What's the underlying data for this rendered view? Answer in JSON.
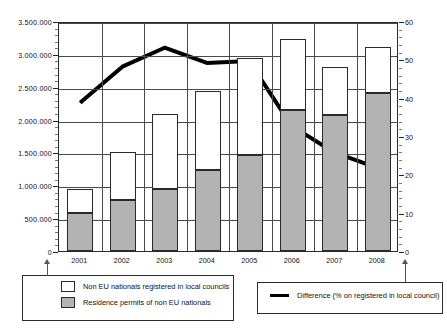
{
  "chart_data": {
    "type": "bar",
    "title": "",
    "subtitle": "",
    "xlabel": "",
    "ylabel": "",
    "y2label": "",
    "categories": [
      "2001",
      "2002",
      "2003",
      "2004",
      "2005",
      "2006",
      "2007",
      "2008"
    ],
    "ylim": [
      0,
      3500000
    ],
    "yticks": [
      "0",
      "500.000",
      "1.000.000",
      "1.500.000",
      "2.000.000",
      "2.500.000",
      "3.000.000",
      "3.500.000"
    ],
    "ytick_values": [
      0,
      500000,
      1000000,
      1500000,
      2000000,
      2500000,
      3000000,
      3500000
    ],
    "y2lim": [
      0,
      60
    ],
    "y2ticks": [
      "0",
      "10",
      "20",
      "30",
      "40",
      "50",
      "60"
    ],
    "y2tick_values": [
      0,
      10,
      20,
      30,
      40,
      50,
      60
    ],
    "grid": true,
    "stacked": true,
    "legend_position": "below",
    "series": [
      {
        "name": "Residence permits of non EU nationals",
        "type": "bar",
        "stack_position": "bottom",
        "color": "#b3b3b3",
        "axis": "left",
        "values": [
          580000,
          770000,
          950000,
          1230000,
          1460000,
          2150000,
          2070000,
          2410000
        ]
      },
      {
        "name": "Non EU nationals registered in local councils",
        "type": "bar",
        "stack_position": "top",
        "color": "#ffffff",
        "axis": "left",
        "values": [
          950000,
          1500000,
          2080000,
          2440000,
          2940000,
          3220000,
          2800000,
          3100000
        ],
        "note": "values are cumulative bar totals"
      },
      {
        "name": "Difference (% on registered in local council)",
        "type": "line",
        "color": "#000000",
        "axis": "right",
        "values": [
          39,
          48.5,
          53.5,
          49.5,
          50,
          33,
          26,
          22
        ]
      }
    ]
  },
  "legend_left": {
    "items": [
      {
        "label": "Non EU nationals registered in local councils",
        "swatch": "white-square"
      },
      {
        "label": "Residence permits of non EU nationals",
        "swatch": "gray-square"
      }
    ]
  },
  "legend_right": {
    "items": [
      {
        "label": "Difference (% on registered in local council)",
        "swatch": "black-line"
      }
    ]
  }
}
